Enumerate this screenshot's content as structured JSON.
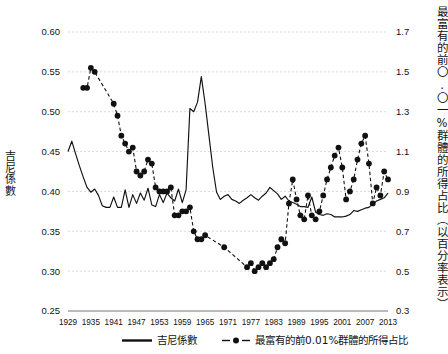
{
  "chart_data": {
    "type": "line",
    "title": "",
    "xlabel": "",
    "ylabel": "吉尼係數",
    "y2label": "最富有的前〇.〇一%群體的所得占比（以百分率表示）",
    "grid": true,
    "legend_position": "bottom",
    "xlim": [
      1929,
      2013
    ],
    "xticks": [
      1929,
      1935,
      1941,
      1947,
      1953,
      1959,
      1965,
      1971,
      1977,
      1983,
      1989,
      1995,
      2001,
      2007,
      2013
    ],
    "ylim": [
      0.25,
      0.6
    ],
    "yticks": [
      0.25,
      0.3,
      0.35,
      0.4,
      0.45,
      0.5,
      0.55,
      0.6
    ],
    "y2lim": [
      0.3,
      1.7
    ],
    "y2ticks": [
      0.3,
      0.5,
      0.7,
      0.9,
      1.1,
      1.3,
      1.5,
      1.7
    ],
    "series": [
      {
        "name": "吉尼係數",
        "axis": "left",
        "style": "solid-line",
        "x": [
          1929,
          1930,
          1931,
          1932,
          1933,
          1934,
          1935,
          1936,
          1937,
          1938,
          1939,
          1940,
          1941,
          1942,
          1943,
          1944,
          1945,
          1946,
          1947,
          1948,
          1949,
          1950,
          1951,
          1952,
          1953,
          1954,
          1955,
          1956,
          1957,
          1958,
          1959,
          1960,
          1961,
          1962,
          1963,
          1964,
          1965,
          1966,
          1967,
          1968,
          1969,
          1970,
          1971,
          1972,
          1973,
          1974,
          1975,
          1976,
          1977,
          1978,
          1979,
          1980,
          1981,
          1982,
          1983,
          1984,
          1985,
          1986,
          1987,
          1988,
          1989,
          1990,
          1991,
          1992,
          1993,
          1994,
          1995,
          1996,
          1997,
          1998,
          1999,
          2000,
          2001,
          2002,
          2003,
          2004,
          2005,
          2006,
          2007,
          2008,
          2009,
          2010,
          2011,
          2012,
          2013
        ],
        "y": [
          0.45,
          0.463,
          0.447,
          0.432,
          0.418,
          0.405,
          0.399,
          0.403,
          0.395,
          0.382,
          0.38,
          0.38,
          0.393,
          0.38,
          0.38,
          0.402,
          0.38,
          0.396,
          0.385,
          0.398,
          0.389,
          0.404,
          0.383,
          0.381,
          0.396,
          0.386,
          0.398,
          0.392,
          0.388,
          0.403,
          0.386,
          0.402,
          0.504,
          0.5,
          0.512,
          0.544,
          0.51,
          0.47,
          0.43,
          0.399,
          0.39,
          0.394,
          0.396,
          0.39,
          0.388,
          0.385,
          0.389,
          0.392,
          0.396,
          0.392,
          0.389,
          0.394,
          0.398,
          0.405,
          0.401,
          0.397,
          0.39,
          0.394,
          0.388,
          0.386,
          0.384,
          0.381,
          0.381,
          0.38,
          0.393,
          0.374,
          0.371,
          0.37,
          0.372,
          0.371,
          0.368,
          0.368,
          0.368,
          0.369,
          0.371,
          0.376,
          0.375,
          0.377,
          0.379,
          0.38,
          0.384,
          0.388,
          0.39,
          0.392,
          0.398
        ],
        "note": "Gini coefficient, left axis"
      },
      {
        "name": "最富有的前0.01%群體的所得占比",
        "axis": "right",
        "style": "dashed-line-with-dots",
        "x": [
          1933,
          1934,
          1935,
          1936,
          1941,
          1942,
          1943,
          1944,
          1945,
          1946,
          1947,
          1948,
          1949,
          1950,
          1951,
          1952,
          1953,
          1954,
          1955,
          1956,
          1957,
          1958,
          1959,
          1960,
          1961,
          1962,
          1963,
          1964,
          1965,
          1970,
          1976,
          1977,
          1978,
          1979,
          1980,
          1981,
          1982,
          1983,
          1984,
          1985,
          1986,
          1987,
          1988,
          1989,
          1990,
          1991,
          1992,
          1993,
          1994,
          1995,
          1996,
          1997,
          1998,
          1999,
          2000,
          2001,
          2002,
          2003,
          2004,
          2005,
          2006,
          2007,
          2008,
          2009,
          2010,
          2011,
          2012,
          2013
        ],
        "y": [
          1.42,
          1.42,
          1.52,
          1.5,
          1.34,
          1.28,
          1.18,
          1.14,
          1.1,
          1.12,
          1.0,
          0.98,
          1.0,
          1.06,
          1.04,
          0.92,
          0.9,
          0.9,
          0.9,
          0.92,
          0.78,
          0.78,
          0.8,
          0.8,
          0.82,
          0.7,
          0.66,
          0.66,
          0.68,
          0.62,
          0.52,
          0.54,
          0.5,
          0.52,
          0.54,
          0.52,
          0.54,
          0.56,
          0.62,
          0.66,
          0.64,
          0.84,
          0.96,
          0.86,
          0.78,
          0.76,
          0.88,
          0.78,
          0.76,
          0.8,
          0.88,
          0.96,
          1.02,
          1.08,
          1.12,
          1.02,
          0.86,
          0.9,
          0.96,
          1.06,
          1.14,
          1.18,
          1.04,
          0.84,
          0.92,
          0.88,
          1.0,
          0.96
        ],
        "note": "Top 0.01% income share (%), right axis"
      }
    ],
    "legend": [
      {
        "label": "吉尼係數",
        "marker": "solid-line"
      },
      {
        "label": "最富有的前0.01%群體的所得占比",
        "marker": "dashed-dot"
      }
    ]
  },
  "axes": {
    "left_title": "吉尼係數",
    "right_title": "最富有的前〇.〇一%群體的所得占比（以百分率表示）"
  },
  "colors": {
    "line": "#111111",
    "grid": "#cfcfcf",
    "axis": "#555555",
    "background": "#ffffff"
  }
}
